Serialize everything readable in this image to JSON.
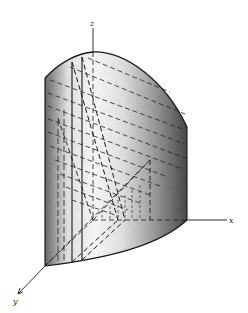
{
  "figure": {
    "type": "3d-solid-region",
    "axes": {
      "x_label": "x",
      "y_label": "y",
      "z_label": "z"
    },
    "colors": {
      "line": "#1a1a1a",
      "shade_dark": "#555555",
      "shade_light": "#f2f2f2",
      "background": "#ffffff"
    }
  }
}
